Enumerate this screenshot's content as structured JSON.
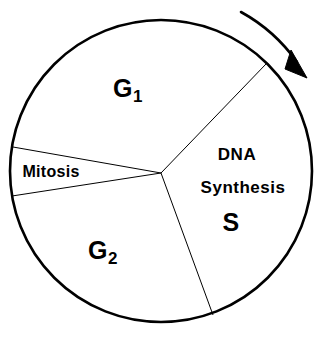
{
  "diagram": {
    "type": "cell-cycle-pie",
    "background_color": "#ffffff",
    "stroke_color": "#000000",
    "circle": {
      "center_x": 161,
      "center_y": 171,
      "radius": 151,
      "outline_width": 2.6
    },
    "hub": {
      "x": 161,
      "y": 173
    },
    "spoke_width": 1.0,
    "wedges": [
      {
        "id": "g1",
        "name": "G1",
        "label_main": "G",
        "label_sub": "1",
        "start_angle": -46,
        "end_angle": -171,
        "label_x": 128,
        "label_y": 90,
        "font_class": "phase-big"
      },
      {
        "id": "s",
        "name": "S",
        "label_line1": "DNA",
        "label_line2": "Synthesis",
        "label_line3": "S",
        "start_angle": -46,
        "end_angle": 70,
        "line1_x": 237,
        "line1_y": 156,
        "line2_x": 243,
        "line2_y": 189,
        "line3_x": 231,
        "line3_y": 224
      },
      {
        "id": "g2",
        "name": "G2",
        "label_main": "G",
        "label_sub": "2",
        "start_angle": 70,
        "end_angle": 171,
        "label_x": 103,
        "label_y": 252,
        "font_class": "phase-big"
      },
      {
        "id": "mitosis",
        "name": "Mitosis",
        "label_main": "Mitosis",
        "start_angle": 171,
        "end_angle": 189,
        "label_x": 51,
        "label_y": 173,
        "font_class": "phase-small"
      }
    ],
    "direction_arrow": {
      "name": "clockwise-arrow",
      "description": "curved clockwise arrow outside upper-right of circle",
      "start_x": 241,
      "start_y": 12,
      "end_x": 299,
      "end_y": 64,
      "arc_radius": 168,
      "stroke_width": 2.6,
      "head_points": "299,58 306,76 288,70"
    }
  }
}
